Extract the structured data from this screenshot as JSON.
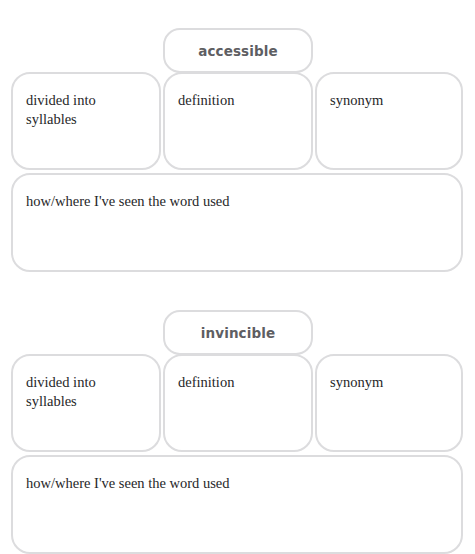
{
  "page": {
    "clipped_top_text": ""
  },
  "diagrams": [
    {
      "word": "accessible",
      "columns": [
        {
          "label": "divided into syllables"
        },
        {
          "label": "definition"
        },
        {
          "label": "synonym"
        }
      ],
      "usage_box": {
        "label": "how/where I've seen the word used"
      }
    },
    {
      "word": "invincible",
      "columns": [
        {
          "label": "divided into syllables"
        },
        {
          "label": "definition"
        },
        {
          "label": "synonym"
        }
      ],
      "usage_box": {
        "label": "how/where I've seen the word used"
      }
    }
  ],
  "colors": {
    "box_border": "#dcdcde",
    "word_text": "#5e5e62",
    "label_text": "#262628",
    "background": "#ffffff"
  }
}
